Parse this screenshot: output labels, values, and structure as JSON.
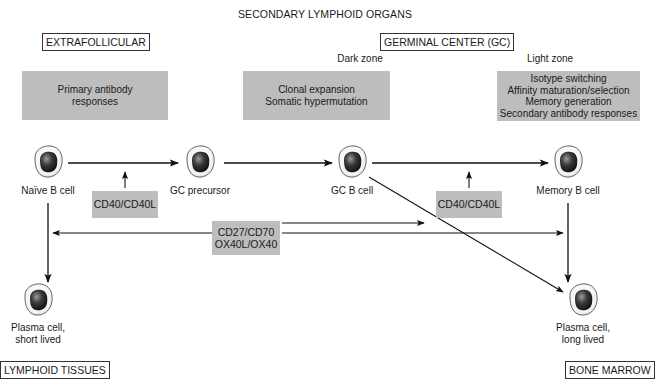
{
  "title": "SECONDARY LYMPHOID ORGANS",
  "regions": {
    "extrafollicular": "EXTRAFOLLICULAR",
    "germinal_center": "GERMINAL CENTER (GC)",
    "lymphoid_tissues": "LYMPHOID TISSUES",
    "bone_marrow": "BONE MARROW"
  },
  "zones": {
    "dark": "Dark zone",
    "light": "Light zone"
  },
  "function_boxes": {
    "extrafollicular": [
      "Primary antibody",
      "responses"
    ],
    "dark_zone": [
      "Clonal expansion",
      "Somatic hypermutation"
    ],
    "light_zone": [
      "Isotype switching",
      "Affinity maturation/selection",
      "Memory generation",
      "Secondary antibody responses"
    ]
  },
  "cells": {
    "naive": "Naïve B cell",
    "gc_precursor": "GC precursor",
    "gc_b": "GC B cell",
    "memory": "Memory B cell",
    "plasma_short": [
      "Plasma cell,",
      "short lived"
    ],
    "plasma_long": [
      "Plasma cell,",
      "long lived"
    ]
  },
  "signals": {
    "cd40_left": "CD40/CD40L",
    "cd40_right": "CD40/CD40L",
    "costim": [
      "CD27/CD70",
      "OX40L/OX40"
    ]
  },
  "colors": {
    "box_gray": "#bdbdbd",
    "line": "#111111",
    "cell_nucleus": "#2a2a2a",
    "cell_membrane": "#e9e9e9"
  }
}
